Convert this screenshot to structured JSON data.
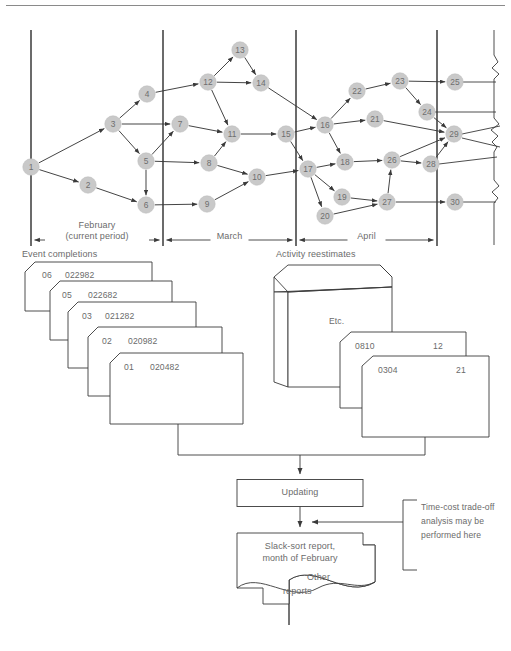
{
  "figure": {
    "top_rule": true,
    "network": {
      "nodes": [
        {
          "id": "1",
          "x": 31,
          "y": 167
        },
        {
          "id": "2",
          "x": 88,
          "y": 185
        },
        {
          "id": "3",
          "x": 113,
          "y": 124
        },
        {
          "id": "4",
          "x": 147,
          "y": 94
        },
        {
          "id": "5",
          "x": 146,
          "y": 161
        },
        {
          "id": "6",
          "x": 146,
          "y": 205
        },
        {
          "id": "7",
          "x": 180,
          "y": 124
        },
        {
          "id": "8",
          "x": 209,
          "y": 163
        },
        {
          "id": "9",
          "x": 207,
          "y": 204
        },
        {
          "id": "10",
          "x": 257,
          "y": 177
        },
        {
          "id": "11",
          "x": 232,
          "y": 134
        },
        {
          "id": "12",
          "x": 208,
          "y": 82
        },
        {
          "id": "13",
          "x": 240,
          "y": 50
        },
        {
          "id": "14",
          "x": 261,
          "y": 83
        },
        {
          "id": "15",
          "x": 286,
          "y": 134
        },
        {
          "id": "16",
          "x": 325,
          "y": 125
        },
        {
          "id": "17",
          "x": 308,
          "y": 169
        },
        {
          "id": "18",
          "x": 345,
          "y": 162
        },
        {
          "id": "19",
          "x": 342,
          "y": 197
        },
        {
          "id": "20",
          "x": 325,
          "y": 216
        },
        {
          "id": "21",
          "x": 375,
          "y": 119
        },
        {
          "id": "22",
          "x": 357,
          "y": 91
        },
        {
          "id": "23",
          "x": 400,
          "y": 81
        },
        {
          "id": "24",
          "x": 427,
          "y": 112
        },
        {
          "id": "25",
          "x": 455,
          "y": 82
        },
        {
          "id": "26",
          "x": 392,
          "y": 160
        },
        {
          "id": "27",
          "x": 387,
          "y": 202
        },
        {
          "id": "28",
          "x": 431,
          "y": 164
        },
        {
          "id": "29",
          "x": 454,
          "y": 134
        },
        {
          "id": "30",
          "x": 455,
          "y": 202
        }
      ],
      "edges": [
        [
          "1",
          "3"
        ],
        [
          "1",
          "2"
        ],
        [
          "2",
          "6"
        ],
        [
          "3",
          "4"
        ],
        [
          "3",
          "5"
        ],
        [
          "3",
          "7"
        ],
        [
          "5",
          "6"
        ],
        [
          "5",
          "7"
        ],
        [
          "5",
          "8"
        ],
        [
          "4",
          "12"
        ],
        [
          "6",
          "9"
        ],
        [
          "7",
          "11"
        ],
        [
          "8",
          "11"
        ],
        [
          "8",
          "10"
        ],
        [
          "9",
          "10"
        ],
        [
          "12",
          "13"
        ],
        [
          "12",
          "14"
        ],
        [
          "12",
          "11"
        ],
        [
          "13",
          "14"
        ],
        [
          "11",
          "15"
        ],
        [
          "10",
          "17"
        ],
        [
          "14",
          "16"
        ],
        [
          "15",
          "16"
        ],
        [
          "15",
          "17"
        ],
        [
          "16",
          "22"
        ],
        [
          "16",
          "21"
        ],
        [
          "16",
          "18"
        ],
        [
          "17",
          "18"
        ],
        [
          "17",
          "19"
        ],
        [
          "17",
          "20"
        ],
        [
          "22",
          "23"
        ],
        [
          "23",
          "24"
        ],
        [
          "23",
          "25"
        ],
        [
          "21",
          "29"
        ],
        [
          "18",
          "26"
        ],
        [
          "26",
          "28"
        ],
        [
          "26",
          "29"
        ],
        [
          "19",
          "27"
        ],
        [
          "20",
          "27"
        ],
        [
          "27",
          "26"
        ],
        [
          "27",
          "30"
        ],
        [
          "28",
          "29"
        ],
        [
          "24",
          "29"
        ]
      ],
      "dividers_x": [
        31,
        163,
        296,
        437
      ],
      "divider_top": 30,
      "divider_bottom": 246
    },
    "timeline": {
      "periods": [
        {
          "label_line1": "February",
          "label_line2": "(current period)",
          "x1": 31,
          "x2": 163
        },
        {
          "label_line1": "March",
          "label_line2": "",
          "x1": 163,
          "x2": 296
        },
        {
          "label_line1": "April",
          "label_line2": "",
          "x1": 296,
          "x2": 437
        }
      ]
    },
    "event_completions": {
      "title": "Event completions",
      "cards": [
        {
          "code": "06",
          "date": "022982"
        },
        {
          "code": "05",
          "date": "022682"
        },
        {
          "code": "03",
          "date": "021282"
        },
        {
          "code": "02",
          "date": "020982"
        },
        {
          "code": "01",
          "date": "020482"
        }
      ]
    },
    "activity_reestimates": {
      "title": "Activity reestimates",
      "block_label": "Etc.",
      "cards": [
        {
          "code": "0810",
          "value": "12"
        },
        {
          "code": "0304",
          "value": "21"
        }
      ]
    },
    "process": {
      "updating_label": "Updating",
      "report_line1": "Slack-sort report,",
      "report_line2": "month of February",
      "other_reports_line1": "Other",
      "other_reports_line2": "reports",
      "annotation_line1": "Time-cost trade-off",
      "annotation_line2": "analysis may be",
      "annotation_line3": "performed here"
    },
    "colors": {
      "node_fill": "#c9c9c9",
      "node_text": "#6e6e6e",
      "line": "#3a3a3a",
      "text": "#6b6b6b",
      "rule": "#8a8a8a"
    }
  }
}
